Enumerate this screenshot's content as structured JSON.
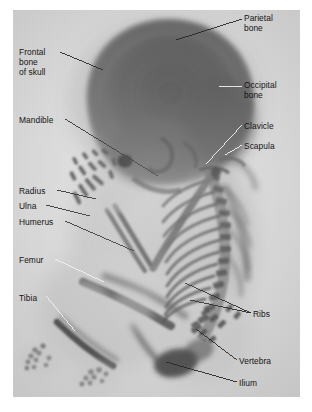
{
  "figure": {
    "type": "radiograph",
    "panel": {
      "background_color": "#cfcfcf",
      "border_color": "#ffffff",
      "x": 13,
      "y": 10,
      "width": 287,
      "height": 387
    },
    "text_color": "#141414",
    "leader_color_dark": "#1a1a1a",
    "leader_color_light": "#f2f2f2"
  },
  "labels": [
    {
      "id": "parietal-bone",
      "text": "Parietal\nbone",
      "x": 244,
      "y": 13,
      "side": "right",
      "leader": {
        "from_x": 242,
        "from_y": 19,
        "to_x": 176,
        "to_y": 40,
        "style": "dark"
      }
    },
    {
      "id": "frontal-bone-of-skull",
      "text": "Frontal\nbone\nof skull",
      "x": 19,
      "y": 47,
      "side": "left",
      "leader": {
        "from_x": 60,
        "from_y": 52,
        "to_x": 103,
        "to_y": 70,
        "style": "dark"
      }
    },
    {
      "id": "occipital-bone",
      "text": "Occipital\nbone",
      "x": 244,
      "y": 80,
      "side": "right",
      "leader": {
        "from_x": 242,
        "from_y": 86,
        "to_x": 219,
        "to_y": 86,
        "style": "light"
      }
    },
    {
      "id": "mandible",
      "text": "Mandible",
      "x": 19,
      "y": 115,
      "side": "left",
      "leader": {
        "from_x": 65,
        "from_y": 119,
        "to_x": 158,
        "to_y": 176,
        "style": "dark"
      }
    },
    {
      "id": "clavicle",
      "text": "Clavicle",
      "x": 244,
      "y": 121,
      "side": "right",
      "leader": {
        "from_x": 242,
        "from_y": 125,
        "to_x": 206,
        "to_y": 164,
        "style": "light"
      }
    },
    {
      "id": "scapula",
      "text": "Scapula",
      "x": 244,
      "y": 141,
      "side": "right",
      "leader": {
        "from_x": 242,
        "from_y": 145,
        "to_x": 225,
        "to_y": 155,
        "style": "light"
      }
    },
    {
      "id": "radius",
      "text": "Radius",
      "x": 19,
      "y": 186,
      "side": "left",
      "leader": {
        "from_x": 57,
        "from_y": 190,
        "to_x": 96,
        "to_y": 199,
        "style": "dark"
      }
    },
    {
      "id": "ulna",
      "text": "Ulna",
      "x": 19,
      "y": 201,
      "side": "left",
      "leader": {
        "from_x": 46,
        "from_y": 205,
        "to_x": 90,
        "to_y": 216,
        "style": "dark"
      }
    },
    {
      "id": "humerus",
      "text": "Humerus",
      "x": 19,
      "y": 217,
      "side": "left",
      "leader": {
        "from_x": 65,
        "from_y": 221,
        "to_x": 134,
        "to_y": 251,
        "style": "dark"
      }
    },
    {
      "id": "femur",
      "text": "Femur",
      "x": 19,
      "y": 255,
      "side": "left",
      "leader": {
        "from_x": 55,
        "from_y": 259,
        "to_x": 104,
        "to_y": 282,
        "style": "light"
      }
    },
    {
      "id": "tibia",
      "text": "Tibia",
      "x": 19,
      "y": 293,
      "side": "left",
      "leader": {
        "from_x": 46,
        "from_y": 296,
        "to_x": 75,
        "to_y": 331,
        "style": "light"
      }
    },
    {
      "id": "ribs",
      "text": "Ribs",
      "x": 253,
      "y": 309,
      "side": "right",
      "leader": {
        "from_x": 251,
        "from_y": 313,
        "to_x": 185,
        "to_y": 283,
        "style": "dark"
      },
      "leader2": {
        "from_x": 251,
        "from_y": 313,
        "to_x": 190,
        "to_y": 300,
        "style": "dark"
      }
    },
    {
      "id": "vertebra",
      "text": "Vertebra",
      "x": 239,
      "y": 356,
      "side": "right",
      "leader": {
        "from_x": 237,
        "from_y": 360,
        "to_x": 196,
        "to_y": 329,
        "style": "dark"
      }
    },
    {
      "id": "ilium",
      "text": "Ilium",
      "x": 239,
      "y": 378,
      "side": "right",
      "leader": {
        "from_x": 237,
        "from_y": 382,
        "to_x": 166,
        "to_y": 362,
        "style": "dark"
      }
    }
  ]
}
